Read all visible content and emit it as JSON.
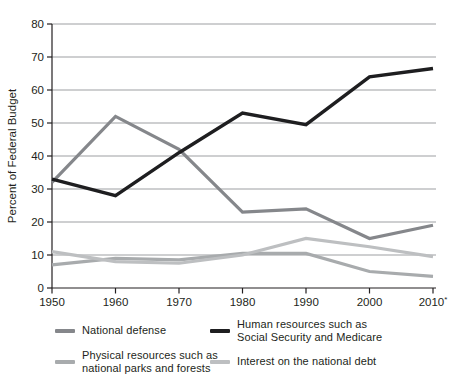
{
  "chart_data": {
    "type": "line",
    "title": "",
    "xlabel": "",
    "ylabel": "Percent of Federal Budget",
    "ylim": [
      0,
      80
    ],
    "yticks": [
      0,
      10,
      20,
      30,
      40,
      50,
      60,
      70,
      80
    ],
    "grid": "horizontal",
    "legend_position": "bottom",
    "categories": [
      "1950",
      "1960",
      "1970",
      "1980",
      "1990",
      "2000",
      "2010"
    ],
    "footnote_marker": "*",
    "footnote_index": 6,
    "axis_color": "#231f20",
    "grid_color": "#9d9fa2",
    "text_color": "#231f20",
    "series": [
      {
        "id": "national-defense",
        "name": "National defense",
        "color": "#85878b",
        "values": [
          32,
          52,
          42,
          23,
          24,
          15,
          19
        ]
      },
      {
        "id": "human-resources",
        "name": "Human resources such as Social Security and Medicare",
        "color": "#1e1e20",
        "values": [
          33,
          28,
          41,
          53,
          49.5,
          64,
          66.5
        ]
      },
      {
        "id": "physical-resources",
        "name": "Physical resources such as national parks and forests",
        "color": "#a8abad",
        "values": [
          7,
          9,
          8.5,
          10.5,
          10.5,
          5,
          3.5
        ]
      },
      {
        "id": "interest-debt",
        "name": "Interest on the national debt",
        "color": "#bdbfc1",
        "values": [
          11,
          8,
          7.5,
          10,
          15,
          12.5,
          9.5
        ]
      }
    ]
  }
}
